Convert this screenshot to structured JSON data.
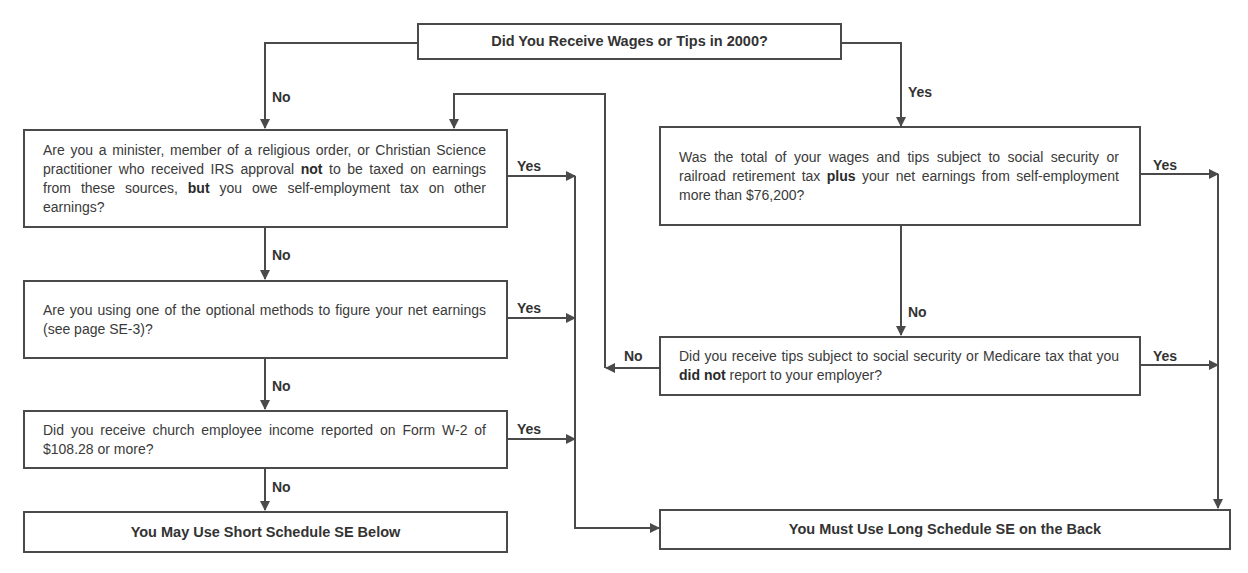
{
  "flowchart": {
    "start": {
      "label": "Did You Receive Wages or Tips in 2000?"
    },
    "left_column": {
      "q1": {
        "pre": "Are you a minister, member of a religious order, or Christian Science practitioner who received IRS approval ",
        "bold1": "not",
        "mid": " to be taxed on earnings from these sources, ",
        "bold2": "but",
        "post": " you owe self-employment tax on other earnings?"
      },
      "q2": {
        "text": "Are you using one of the optional methods to figure your net earnings (see page SE-3)?"
      },
      "q3": {
        "text": "Did you receive church employee income reported on Form W-2 of $108.28 or more?"
      },
      "result_short": {
        "label": "You May Use Short Schedule SE Below"
      }
    },
    "right_column": {
      "q4": {
        "pre": "Was the total of your wages and tips subject to social security or railroad retirement tax ",
        "bold": "plus",
        "post": " your net earnings from self-employment more than $76,200?"
      },
      "q5": {
        "pre": "Did you receive tips subject to social security or Medicare tax that you ",
        "bold": "did not",
        "post": " report to your employer?"
      },
      "result_long": {
        "label": "You Must Use Long Schedule SE on the Back"
      }
    },
    "edge_labels": {
      "start_no": "No",
      "start_yes": "Yes",
      "q1_yes": "Yes",
      "q1_no": "No",
      "q2_yes": "Yes",
      "q2_no": "No",
      "q3_yes": "Yes",
      "q3_no": "No",
      "q4_yes": "Yes",
      "q4_no": "No",
      "q5_yes": "Yes",
      "q5_no": "No"
    },
    "colors": {
      "line": "#4a4a4a",
      "text": "#333333",
      "background": "#ffffff"
    }
  }
}
